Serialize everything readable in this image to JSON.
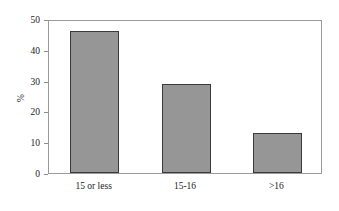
{
  "chart_data": {
    "type": "bar",
    "title": "",
    "subtitle": "",
    "xlabel": "",
    "ylabel": "%",
    "categories": [
      "15 or less",
      "15-16",
      ">16"
    ],
    "values": [
      46,
      29,
      13
    ],
    "series": [
      {
        "name": "%",
        "values": [
          46,
          29,
          13
        ]
      }
    ],
    "ylim": [
      0,
      50
    ],
    "yticks": [
      0,
      10,
      20,
      30,
      40,
      50
    ],
    "ytick_labels": [
      "0",
      "10",
      "20",
      "30",
      "40",
      "50"
    ],
    "grid": false,
    "legend": false,
    "legend_position": "none",
    "annotations": [],
    "style": {
      "bar_fill": "#969696",
      "bar_edge": "#3a3a3a",
      "axis_line": "#9a9a9a",
      "text_color": "#1a1a1a",
      "background": "#ffffff"
    }
  }
}
